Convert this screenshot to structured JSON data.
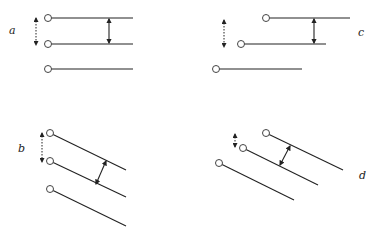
{
  "panels": [
    {
      "label": "a",
      "label_pos": [
        9,
        34
      ],
      "lines": [
        [
          48,
          18,
          133,
          18
        ],
        [
          48,
          44,
          133,
          44
        ],
        [
          48,
          69,
          133,
          69
        ]
      ],
      "dotted_arrow": [
        36,
        18,
        36,
        45
      ],
      "solid_arrow": [
        109,
        19,
        109,
        43
      ]
    },
    {
      "label": "c",
      "label_pos": [
        358,
        36
      ],
      "lines": [
        [
          266,
          18,
          350,
          18
        ],
        [
          241,
          44,
          326,
          44
        ],
        [
          216,
          69,
          302,
          69
        ]
      ],
      "dotted_arrow": [
        224,
        20,
        224,
        47
      ],
      "solid_arrow": [
        314,
        19,
        314,
        43
      ]
    },
    {
      "label": "b",
      "label_pos": [
        18,
        152
      ],
      "lines": [
        [
          50,
          133,
          126,
          170
        ],
        [
          50,
          161,
          126,
          197
        ],
        [
          50,
          189,
          126,
          226
        ]
      ],
      "dotted_arrow": [
        42,
        133,
        42,
        162
      ],
      "solid_arrow": [
        106,
        161,
        96,
        184
      ]
    },
    {
      "label": "d",
      "label_pos": [
        359,
        179
      ],
      "lines": [
        [
          266,
          133,
          343,
          170
        ],
        [
          243,
          148,
          318,
          185
        ],
        [
          219,
          163,
          294,
          200
        ]
      ],
      "dotted_arrow": [
        235,
        134,
        235,
        147
      ],
      "solid_arrow": [
        290,
        146,
        280,
        165
      ]
    }
  ]
}
